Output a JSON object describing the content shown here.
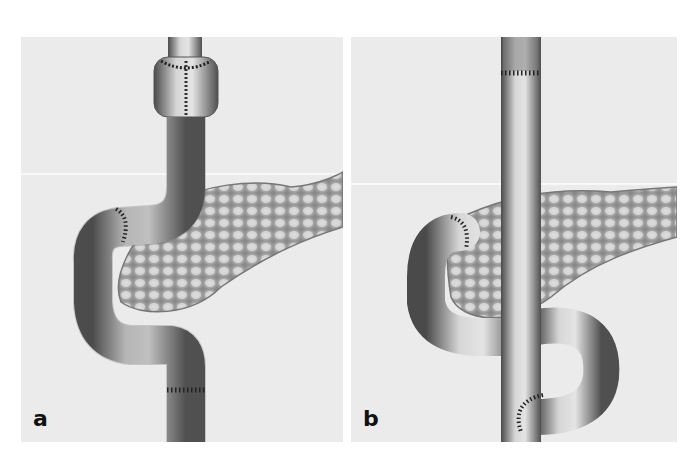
{
  "figure": {
    "panels": [
      {
        "id": "a",
        "label": "a",
        "description": "Bowel segment with pouch below esophagus, looping around pancreas head, sutured anastomoses"
      },
      {
        "id": "b",
        "label": "b",
        "description": "Straight vertical bowel segment with side loop and sutured end-to-side anastomosis, pancreas behind"
      }
    ],
    "colors": {
      "background": "#ffffff",
      "panel_bg": "#ebebeb",
      "tissue_light": "#d8d8d8",
      "tissue_dark": "#5a5a5a",
      "suture": "#222222",
      "pancreas": "#bdbdbd"
    }
  }
}
